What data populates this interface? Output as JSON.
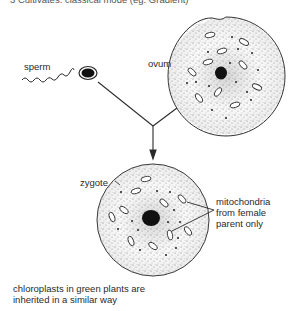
{
  "header": {
    "cut_off_text": "3  Cultivates: classical mode (eg: Gradient)"
  },
  "labels": {
    "sperm": "sperm",
    "ovum": "ovum",
    "zygote": "zygote",
    "mitochondria_line1": "mitochondria",
    "mitochondria_line2": "from female",
    "mitochondria_line3": "parent only",
    "footnote_line1": "chloroplasts in green plants are",
    "footnote_line2": "inherited in a similar way"
  },
  "colors": {
    "ink": "#2a2a2a",
    "stipple": "#777777",
    "background": "#ffffff"
  }
}
